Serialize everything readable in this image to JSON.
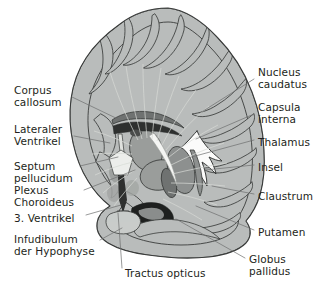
{
  "figure": {
    "type": "anatomical-illustration",
    "view": "coronal-section",
    "language": "de",
    "size": {
      "width": 320,
      "height": 295
    }
  },
  "palette": {
    "background": "#ffffff",
    "cortex_gray_matter": "#b9bcbb",
    "cortex_gray_matter_light": "#c9ccca",
    "white_matter": "#f2f3f1",
    "white_matter_shadow": "#e2e4e1",
    "nucleus_mid": "#9a9d9b",
    "nucleus_dark": "#6f7271",
    "nucleus_darkest": "#2f3130",
    "ventricle_fill": "#fbfbfa",
    "outline": "#3a3c3b",
    "leader_line": "#6d6f6e",
    "text": "#231f20"
  },
  "labels_left": [
    {
      "id": "corpus-callosum",
      "lines": [
        "Corpus",
        "callosum"
      ],
      "x": 14,
      "y": 84,
      "leader": [
        [
          72,
          97
        ],
        [
          120,
          120
        ]
      ]
    },
    {
      "id": "lateraler-ventrikel",
      "lines": [
        "Lateraler",
        "Ventrikel"
      ],
      "x": 14,
      "y": 123,
      "leader": [
        [
          74,
          136
        ],
        [
          110,
          143
        ]
      ]
    },
    {
      "id": "septum-pellucidum",
      "lines": [
        "Septum",
        "pellucidum"
      ],
      "x": 14,
      "y": 160,
      "leader": [
        [
          80,
          166
        ],
        [
          118,
          157
        ]
      ]
    },
    {
      "id": "plexus-choroideus",
      "lines": [
        "Plexus",
        "Choroideus"
      ],
      "x": 14,
      "y": 184,
      "leader": [
        [
          84,
          190
        ],
        [
          135,
          170
        ]
      ]
    },
    {
      "id": "dritte-ventrikel",
      "lines": [
        "3. Ventrikel"
      ],
      "x": 14,
      "y": 212,
      "leader": [
        [
          86,
          215
        ],
        [
          121,
          205
        ]
      ]
    },
    {
      "id": "infudibulum-hypophyse",
      "lines": [
        "Infudibulum",
        "der Hypophyse"
      ],
      "x": 14,
      "y": 233,
      "leader": [
        [
          100,
          240
        ],
        [
          122,
          228
        ]
      ]
    }
  ],
  "labels_right": [
    {
      "id": "nucleus-caudatus",
      "lines": [
        "Nucleus",
        "caudatus"
      ],
      "x": 258,
      "y": 66,
      "leader": [
        [
          254,
          79
        ],
        [
          200,
          113
        ]
      ]
    },
    {
      "id": "capsula-interna",
      "lines": [
        "Capsula",
        "interna"
      ],
      "x": 258,
      "y": 101,
      "leader": [
        [
          254,
          114
        ],
        [
          196,
          139
        ]
      ]
    },
    {
      "id": "thalamus",
      "lines": [
        "Thalamus"
      ],
      "x": 258,
      "y": 136,
      "leader": [
        [
          254,
          140
        ],
        [
          188,
          158
        ]
      ]
    },
    {
      "id": "insel",
      "lines": [
        "Insel"
      ],
      "x": 258,
      "y": 161,
      "leader": [
        [
          254,
          165
        ],
        [
          205,
          170
        ]
      ]
    },
    {
      "id": "claustrum",
      "lines": [
        "Claustrum"
      ],
      "x": 258,
      "y": 190,
      "leader": [
        [
          254,
          194
        ],
        [
          212,
          186
        ]
      ]
    },
    {
      "id": "putamen",
      "lines": [
        "Putamen"
      ],
      "x": 258,
      "y": 226,
      "leader": [
        [
          254,
          230
        ],
        [
          196,
          206
        ]
      ]
    },
    {
      "id": "globus-pallidus",
      "lines": [
        "Globus",
        "pallidus"
      ],
      "x": 249,
      "y": 253,
      "leader": [
        [
          245,
          258
        ],
        [
          176,
          219
        ]
      ]
    }
  ],
  "labels_bottom": [
    {
      "id": "tractus-opticus",
      "lines": [
        "Tractus opticus"
      ],
      "x": 125,
      "y": 267,
      "leader": [
        [
          122,
          268
        ],
        [
          118,
          213
        ]
      ]
    }
  ]
}
